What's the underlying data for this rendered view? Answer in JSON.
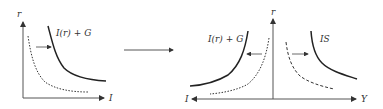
{
  "left_panel": {
    "y_axis_label": "r",
    "x_axis_label": "I",
    "curve_label": "I(r) + G"
  },
  "transition_arrow": "right-arrow",
  "right_panel": {
    "y_axis_label": "r",
    "x_axis_left_label": "I",
    "x_axis_right_label": "Y",
    "left_curve_label": "I(r) + G",
    "right_curve_label": "IS"
  }
}
